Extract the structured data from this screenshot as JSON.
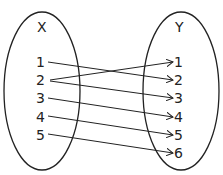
{
  "diagram": {
    "type": "mapping-diagram",
    "domain_set": {
      "label": "X",
      "elements": [
        "1",
        "2",
        "3",
        "4",
        "5"
      ]
    },
    "codomain_set": {
      "label": "Y",
      "elements": [
        "1",
        "2",
        "3",
        "4",
        "5",
        "6"
      ]
    },
    "mappings": [
      {
        "from": "1",
        "to": "2"
      },
      {
        "from": "2",
        "to": "1"
      },
      {
        "from": "2",
        "to": "3"
      },
      {
        "from": "3",
        "to": "4"
      },
      {
        "from": "4",
        "to": "5"
      },
      {
        "from": "5",
        "to": "6"
      }
    ],
    "colors": {
      "stroke": "#222222",
      "background": "#ffffff"
    }
  }
}
